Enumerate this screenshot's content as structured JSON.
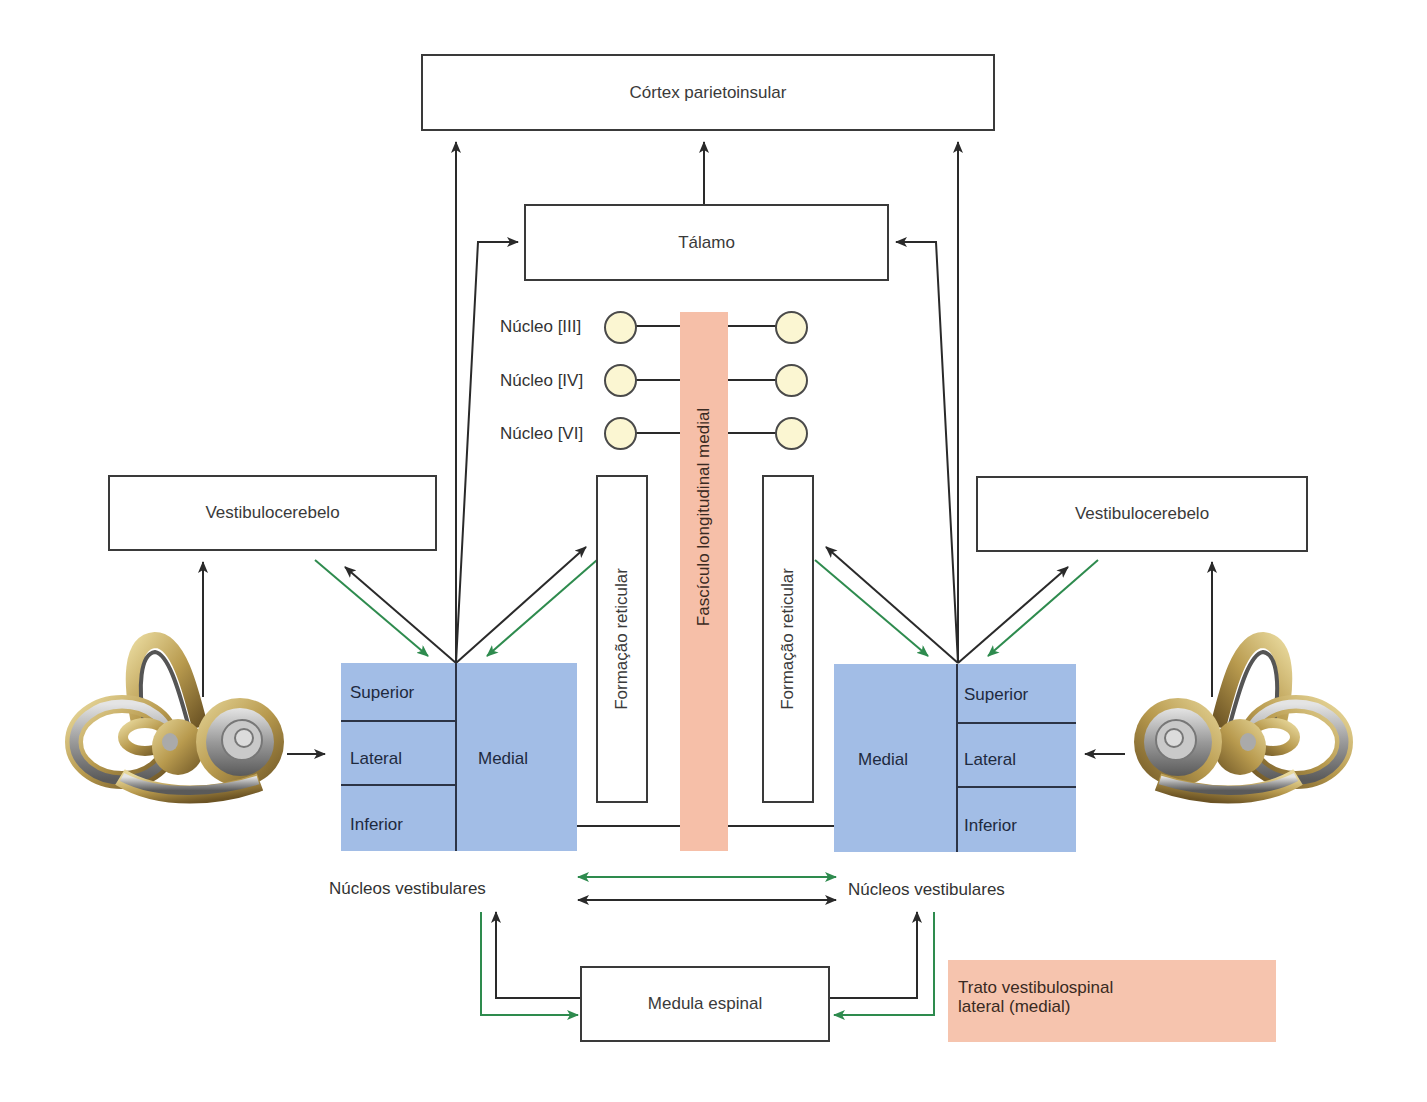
{
  "diagram": {
    "cortex": "Córtex parietoinsular",
    "thalamus": "Tálamo",
    "vestibulocerebellum_left": "Vestibulocerebelo",
    "vestibulocerebellum_right": "Vestibulocerebelo",
    "reticular_left": "Formação reticular",
    "reticular_right": "Formação reticular",
    "mlf": "Fascículo longitudinal medial",
    "cranial_nuclei": [
      "Núcleo [III]",
      "Núcleo [IV]",
      "Núcleo [VI]"
    ],
    "vestibular_nuclei_left": {
      "superior": "Superior",
      "lateral": "Lateral",
      "inferior": "Inferior",
      "medial": "Medial",
      "caption": "Núcleos vestibulares"
    },
    "vestibular_nuclei_right": {
      "superior": "Superior",
      "lateral": "Lateral",
      "inferior": "Inferior",
      "medial": "Medial",
      "caption": "Núcleos vestibulares"
    },
    "spinal_cord": "Medula espinal",
    "legend": {
      "line1": "Trato vestibulospinal",
      "line2": "lateral (medial)",
      "color": "#f6c4ae"
    },
    "icons": {
      "left_ear": "inner-ear-labyrinth-illustration",
      "right_ear": "inner-ear-labyrinth-illustration"
    },
    "colors": {
      "nuclei_fill": "#a2bde6",
      "mlf_fill": "#f6bfa8",
      "cranial_nucleus_fill": "#fbf6d2",
      "black_arrow": "#2a2a2a",
      "green_arrow": "#2e8b4e"
    }
  }
}
